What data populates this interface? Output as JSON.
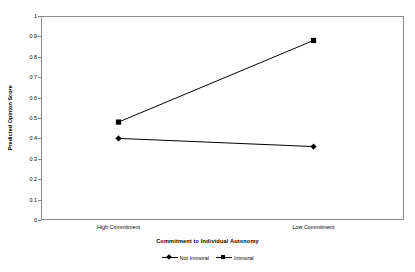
{
  "chart_data": {
    "type": "line",
    "title": "",
    "xlabel": "Commitment to Individual Autonomy",
    "ylabel": "Predicted Opinion Score",
    "categories": [
      "High Commitment",
      "Low Commitment"
    ],
    "ylim": [
      0,
      1
    ],
    "yticks": [
      "0",
      "0.1",
      "0.2",
      "0.3",
      "0.4",
      "0.5",
      "0.6",
      "0.7",
      "0.8",
      "0.9",
      "1"
    ],
    "ytick_values": [
      0,
      0.1,
      0.2,
      0.3,
      0.4,
      0.5,
      0.6,
      0.7,
      0.8,
      0.9,
      1
    ],
    "grid": false,
    "legend_position": "bottom",
    "series": [
      {
        "name": "Not Immoral",
        "marker": "diamond",
        "color": "#000000",
        "values": [
          0.4,
          0.36
        ]
      },
      {
        "name": "Immoral",
        "marker": "square",
        "color": "#000000",
        "values": [
          0.48,
          0.88
        ]
      }
    ]
  },
  "axes": {
    "y_title": "Predicted Opinion Score",
    "x_title": "Commitment to Individual Autonomy",
    "y_tick_labels": [
      "1",
      "0.9",
      "0.8",
      "0.7",
      "0.6",
      "0.5",
      "0.4",
      "0.3",
      "0.2",
      "0.1",
      "0"
    ],
    "x_tick_labels": [
      "High Commitment",
      "Low Commitment"
    ]
  },
  "legend": {
    "entries": [
      {
        "label": "Not Immoral",
        "marker": "diamond"
      },
      {
        "label": "Immoral",
        "marker": "square"
      }
    ]
  },
  "colors": {
    "frame": "#8a8a8a",
    "ink": "#000000",
    "background": "#ffffff"
  }
}
